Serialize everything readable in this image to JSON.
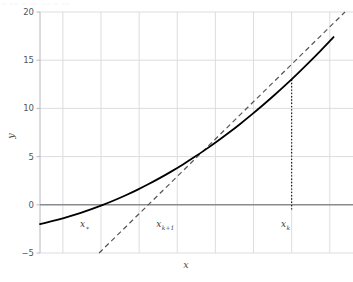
{
  "figure": {
    "top_partial_text": "– –– – –– –– – ––",
    "background_color": "#ffffff"
  },
  "chart_data": {
    "type": "line",
    "title": "",
    "subtitle": "",
    "xlabel": "x",
    "ylabel": "y",
    "xlim": [
      -3.6,
      4.4
    ],
    "ylim": [
      -5,
      20
    ],
    "grid": true,
    "legend": null,
    "axis_colors": {
      "grid": "#d9d9dd",
      "zero_line": "#8a8a8f",
      "spine": "#b8b8bd",
      "curve": "#000000",
      "tangent": "#555558",
      "dotted": "#1a1a1a"
    },
    "xticks": [
      -3,
      -2,
      -1,
      0,
      1,
      2,
      3,
      4
    ],
    "xtick_labels": [
      "",
      "",
      "",
      "",
      "",
      "",
      "",
      ""
    ],
    "yticks": [
      -5,
      0,
      5,
      10,
      15,
      20
    ],
    "ytick_labels": [
      "−5",
      "0",
      "5",
      "10",
      "15",
      "20"
    ],
    "series": [
      {
        "name": "f(x)",
        "style": "solid",
        "color": "#000000",
        "width": 1.8,
        "description": "smooth convex increasing curve (quadratic-like), f(x) = x^2/1.0 passing near (-3.6,-2) rising to (4.4,20)",
        "x": [
          -3.6,
          -3.3,
          -3.0,
          -2.7,
          -2.4,
          -2.1,
          -1.8,
          -1.5,
          -1.2,
          -0.9,
          -0.6,
          -0.3,
          0.0,
          0.3,
          0.6,
          0.9,
          1.2,
          1.5,
          1.8,
          2.1,
          2.4,
          2.7,
          3.0,
          3.3,
          3.6,
          3.9,
          4.1
        ],
        "y": [
          -2.0,
          -1.72,
          -1.4,
          -1.05,
          -0.66,
          -0.24,
          0.22,
          0.72,
          1.26,
          1.84,
          2.46,
          3.12,
          3.82,
          4.56,
          5.34,
          6.16,
          7.02,
          7.92,
          8.86,
          9.84,
          10.86,
          11.92,
          13.02,
          14.16,
          15.34,
          16.56,
          17.4
        ]
      },
      {
        "name": "tangent at x_k",
        "style": "dashed",
        "color": "#555558",
        "width": 1.2,
        "description": "tangent line to the curve at x_k, crossing y=0 at x_{k+1}",
        "x": [
          -2.05,
          4.4
        ],
        "y": [
          -5.0,
          20.0
        ]
      },
      {
        "name": "vertical drop at x_k",
        "style": "dotted",
        "color": "#1a1a1a",
        "width": 1.2,
        "description": "dotted vertical segment from the curve point (x_k, 13.0) down through y=0",
        "x": [
          3.0,
          3.0
        ],
        "y": [
          13.0,
          -0.6
        ]
      }
    ],
    "annotations": [
      {
        "id": "x-star",
        "text": "x",
        "sub": "∗",
        "x": -2.55,
        "y": -2.35
      },
      {
        "id": "x-kplus1",
        "text": "x",
        "sub": "k+1",
        "x": -0.55,
        "y": -2.35
      },
      {
        "id": "x-k",
        "text": "x",
        "sub": "k",
        "x": 2.72,
        "y": -2.35
      }
    ],
    "points": [
      {
        "id": "tangency-point",
        "x": 3.0,
        "y": 13.0
      }
    ]
  }
}
